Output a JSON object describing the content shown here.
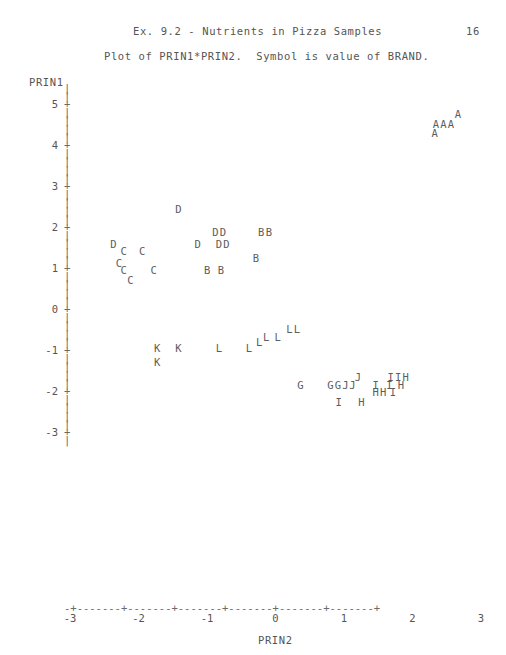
{
  "header": {
    "title": "Ex. 9.2 - Nutrients in Pizza Samples",
    "page_number": "16",
    "subtitle": "Plot of PRIN1*PRIN2.  Symbol is value of BRAND."
  },
  "axes": {
    "y_name": "PRIN1",
    "x_name": "PRIN2",
    "y_ticks": [
      "5",
      "4",
      "3",
      "2",
      "1",
      "0",
      "-1",
      "-2",
      "-3"
    ],
    "x_ticks": [
      "-3",
      "-2",
      "-1",
      "0",
      "1",
      "2",
      "3"
    ],
    "y_tick_glyph": "+",
    "y_line_glyph": "|",
    "x_axis_line": "-+-------+-------+-------+-------+-------+-------+"
  },
  "chart_data": {
    "type": "scatter",
    "title": "Ex. 9.2 - Nutrients in Pizza Samples",
    "subtitle": "Plot of PRIN1*PRIN2.  Symbol is value of BRAND.",
    "xlabel": "PRIN2",
    "ylabel": "PRIN1",
    "xlim": [
      -3,
      3
    ],
    "ylim": [
      -3,
      5
    ],
    "grid": false,
    "legend": "none",
    "symbol_meaning": "value of BRAND",
    "points": [
      {
        "label": "A",
        "x": 2.66,
        "y": 4.75
      },
      {
        "label": "AA",
        "x": 2.34,
        "y": 4.52
      },
      {
        "label": "A",
        "x": 2.56,
        "y": 4.52
      },
      {
        "label": "A",
        "x": 2.32,
        "y": 4.29
      },
      {
        "label": "D",
        "x": -1.42,
        "y": 2.44
      },
      {
        "label": "DD",
        "x": -0.88,
        "y": 1.87
      },
      {
        "label": "BB",
        "x": -0.21,
        "y": 1.87
      },
      {
        "label": "D",
        "x": -2.37,
        "y": 1.59
      },
      {
        "label": "D",
        "x": -1.14,
        "y": 1.59
      },
      {
        "label": "DD",
        "x": -0.83,
        "y": 1.59
      },
      {
        "label": "C",
        "x": -2.22,
        "y": 1.41
      },
      {
        "label": "C",
        "x": -1.95,
        "y": 1.41
      },
      {
        "label": "B",
        "x": -0.29,
        "y": 1.25
      },
      {
        "label": "C",
        "x": -2.29,
        "y": 1.13
      },
      {
        "label": "B",
        "x": -1.0,
        "y": 0.95
      },
      {
        "label": "B",
        "x": -0.8,
        "y": 0.95
      },
      {
        "label": "C",
        "x": -2.22,
        "y": 0.95
      },
      {
        "label": "C",
        "x": -1.78,
        "y": 0.95
      },
      {
        "label": "C",
        "x": -2.12,
        "y": 0.71
      },
      {
        "label": "LL",
        "x": 0.2,
        "y": -0.48
      },
      {
        "label": "L",
        "x": -0.14,
        "y": -0.68
      },
      {
        "label": "L",
        "x": 0.03,
        "y": -0.68
      },
      {
        "label": "L",
        "x": -0.24,
        "y": -0.8
      },
      {
        "label": "K",
        "x": -1.73,
        "y": -0.95
      },
      {
        "label": "K",
        "x": -1.42,
        "y": -0.95
      },
      {
        "label": "L",
        "x": -0.83,
        "y": -0.95
      },
      {
        "label": "L",
        "x": -0.39,
        "y": -0.95
      },
      {
        "label": "K",
        "x": -1.73,
        "y": -1.29
      },
      {
        "label": "J",
        "x": 1.2,
        "y": -1.66
      },
      {
        "label": "IIH",
        "x": 1.68,
        "y": -1.66
      },
      {
        "label": "G",
        "x": 0.36,
        "y": -1.85
      },
      {
        "label": "GGJ",
        "x": 0.8,
        "y": -1.85
      },
      {
        "label": "J",
        "x": 1.12,
        "y": -1.85
      },
      {
        "label": "I",
        "x": 1.46,
        "y": -1.85
      },
      {
        "label": "I",
        "x": 1.66,
        "y": -1.85
      },
      {
        "label": "H",
        "x": 1.83,
        "y": -1.85
      },
      {
        "label": "HH",
        "x": 1.46,
        "y": -2.03
      },
      {
        "label": "I",
        "x": 1.71,
        "y": -2.03
      },
      {
        "label": "I",
        "x": 0.92,
        "y": -2.26
      },
      {
        "label": "H",
        "x": 1.25,
        "y": -2.26
      }
    ]
  }
}
